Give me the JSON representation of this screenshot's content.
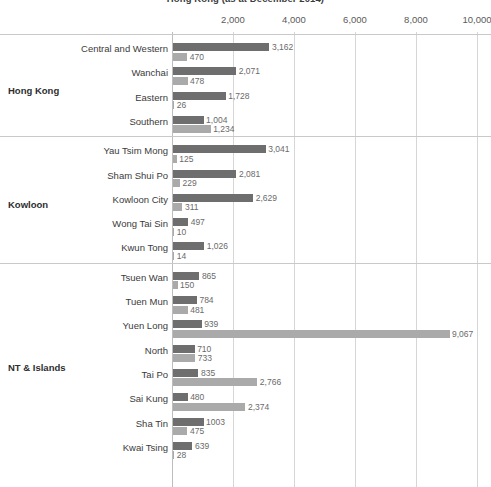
{
  "chart_data": {
    "type": "bar",
    "orientation": "horizontal",
    "title": "Hong Kong (as at December 2014)",
    "xlabel": "",
    "ylabel": "",
    "xlim": [
      0,
      10000
    ],
    "xticks": [
      "2,000",
      "4,000",
      "6,000",
      "8,000",
      "10,000"
    ],
    "xtick_values": [
      2000,
      4000,
      6000,
      8000,
      10000
    ],
    "grid": true,
    "legend_position": "none",
    "series": [
      {
        "name": "series-1",
        "color": "#6e6e6e"
      },
      {
        "name": "series-2",
        "color": "#aaaaaa"
      }
    ],
    "groups": [
      {
        "label": "Hong Kong",
        "categories": [
          {
            "label": "Central and Western",
            "values": [
              3162,
              470
            ],
            "value_labels": [
              "3,162",
              "470"
            ]
          },
          {
            "label": "Wanchai",
            "values": [
              2071,
              478
            ],
            "value_labels": [
              "2,071",
              "478"
            ]
          },
          {
            "label": "Eastern",
            "values": [
              1728,
              26
            ],
            "value_labels": [
              "1,728",
              "26"
            ]
          },
          {
            "label": "Southern",
            "values": [
              1004,
              1234
            ],
            "value_labels": [
              "1,004",
              "1,234"
            ]
          }
        ]
      },
      {
        "label": "Kowloon",
        "categories": [
          {
            "label": "Yau Tsim Mong",
            "values": [
              3041,
              125
            ],
            "value_labels": [
              "3,041",
              "125"
            ]
          },
          {
            "label": "Sham Shui Po",
            "values": [
              2081,
              229
            ],
            "value_labels": [
              "2,081",
              "229"
            ]
          },
          {
            "label": "Kowloon City",
            "values": [
              2629,
              311
            ],
            "value_labels": [
              "2,629",
              "311"
            ]
          },
          {
            "label": "Wong Tai Sin",
            "values": [
              497,
              10
            ],
            "value_labels": [
              "497",
              "10"
            ]
          },
          {
            "label": "Kwun Tong",
            "values": [
              1026,
              14
            ],
            "value_labels": [
              "1,026",
              "14"
            ]
          }
        ]
      },
      {
        "label": "NT & Islands",
        "categories": [
          {
            "label": "Tsuen Wan",
            "values": [
              865,
              150
            ],
            "value_labels": [
              "865",
              "150"
            ]
          },
          {
            "label": "Tuen Mun",
            "values": [
              784,
              481
            ],
            "value_labels": [
              "784",
              "481"
            ]
          },
          {
            "label": "Yuen Long",
            "values": [
              939,
              9067
            ],
            "value_labels": [
              "939",
              "9,067"
            ]
          },
          {
            "label": "North",
            "values": [
              710,
              733
            ],
            "value_labels": [
              "710",
              "733"
            ]
          },
          {
            "label": "Tai Po",
            "values": [
              835,
              2766
            ],
            "value_labels": [
              "835",
              "2,766"
            ]
          },
          {
            "label": "Sai Kung",
            "values": [
              480,
              2374
            ],
            "value_labels": [
              "480",
              "2,374"
            ]
          },
          {
            "label": "Sha Tin",
            "values": [
              1003,
              475
            ],
            "value_labels": [
              "1003",
              "475"
            ]
          },
          {
            "label": "Kwai Tsing",
            "values": [
              639,
              28
            ],
            "value_labels": [
              "639",
              "28"
            ]
          }
        ]
      }
    ]
  }
}
